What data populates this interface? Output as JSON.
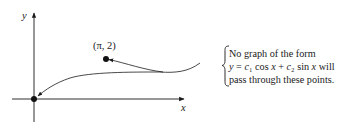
{
  "figure": {
    "axes": {
      "x_label": "x",
      "y_label": "y"
    },
    "points": [
      {
        "name": "origin",
        "label": ""
      },
      {
        "name": "pi-2",
        "label": "(π, 2)"
      }
    ],
    "annotation": {
      "line1": "No graph of the form",
      "line2_parts": [
        "y",
        " = ",
        "c",
        "₁",
        " cos ",
        "x",
        " + ",
        "c",
        "₂",
        " sin ",
        "x",
        " will"
      ],
      "line3": "pass through these points."
    }
  }
}
